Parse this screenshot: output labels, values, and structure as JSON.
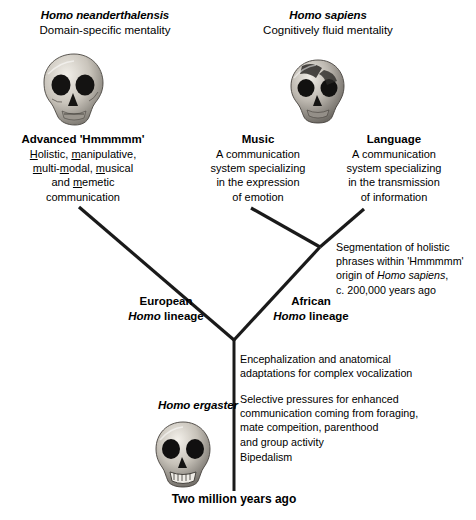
{
  "diagram": {
    "type": "phylogenetic-tree",
    "background_color": "#ffffff",
    "line_color": "#1a1a1a"
  },
  "nodes": {
    "neanderthal": {
      "species": "Homo neanderthalensis",
      "mentality": "Domain-specific mentality",
      "icon": "skull-neanderthal-icon"
    },
    "sapiens": {
      "species": "Homo sapiens",
      "mentality": "Cognitively fluid mentality",
      "icon": "skull-sapiens-icon"
    },
    "ergaster": {
      "species": "Homo ergaster",
      "icon": "skull-ergaster-icon"
    },
    "hmmmmm": {
      "heading": "Advanced 'Hmmmmm'",
      "lines": [
        "Holistic, manipulative,",
        "multi-modal, musical",
        "and memetic",
        "communication"
      ]
    },
    "music": {
      "heading": "Music",
      "lines": [
        "A communication",
        "system specializing",
        "in the expression",
        "of emotion"
      ]
    },
    "language": {
      "heading": "Language",
      "lines": [
        "A communication",
        "system specializing",
        "in the transmission",
        "of information"
      ]
    }
  },
  "lineages": {
    "european": {
      "region": "European",
      "genus": "Homo",
      "suffix": "lineage"
    },
    "african": {
      "region": "African",
      "genus": "Homo",
      "suffix": "lineage"
    }
  },
  "annotations": {
    "segmentation": {
      "line1": "Segmentation of  holistic",
      "line2": "phrases within 'Hmmmmm'",
      "line3_prefix": "origin of ",
      "line3_italic": "Homo sapiens",
      "line3_suffix": ",",
      "line4": "c. 200,000 years ago"
    },
    "trunk": [
      {
        "lines": [
          "Encephalization and anatomical",
          "adaptations for complex vocalization"
        ]
      },
      {
        "lines": [
          "Selective pressures for enhanced",
          "communication coming from foraging,",
          "mate compeition, parenthood",
          "and group activity"
        ]
      },
      {
        "lines": [
          "Bipedalism"
        ]
      }
    ]
  },
  "axis": {
    "root_label": "Two million years ago"
  }
}
